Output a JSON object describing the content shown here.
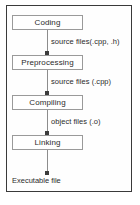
{
  "diagram": {
    "type": "flowchart",
    "orientation": "vertical",
    "title": "",
    "frame": {
      "border_color": "#3a3a3a",
      "background": "#fefefe"
    },
    "stages": [
      {
        "id": "coding",
        "label": "Coding"
      },
      {
        "id": "preprocessing",
        "label": "Preprocessing"
      },
      {
        "id": "compiling",
        "label": "Compiling"
      },
      {
        "id": "linking",
        "label": "Linking"
      }
    ],
    "edges": [
      {
        "from": "coding",
        "to": "preprocessing",
        "label": "source files(.cpp, .h)"
      },
      {
        "from": "preprocessing",
        "to": "compiling",
        "label": "source files (.cpp)"
      },
      {
        "from": "compiling",
        "to": "linking",
        "label": "object files (.o)"
      },
      {
        "from": "linking",
        "to": "executable",
        "label": ""
      }
    ],
    "terminal": {
      "id": "executable",
      "label": "Executable file"
    },
    "colors": {
      "box_border": "#9a9a9a",
      "box_fill": "#ffffff",
      "connector": "#8d8d8d",
      "arrowhead": "#3c3c3c",
      "text": "#2b2b2b"
    }
  }
}
